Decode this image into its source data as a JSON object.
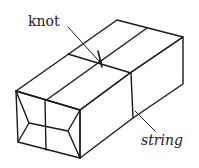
{
  "diagram": {
    "labels": {
      "knot": "knot",
      "string": "string"
    },
    "colors": {
      "line": "#1a1a1a",
      "background": "#ffffff"
    }
  }
}
